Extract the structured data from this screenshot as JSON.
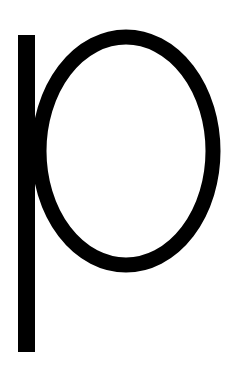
{
  "glyph": {
    "character": "p",
    "color": "#000000",
    "background": "#ffffff"
  }
}
